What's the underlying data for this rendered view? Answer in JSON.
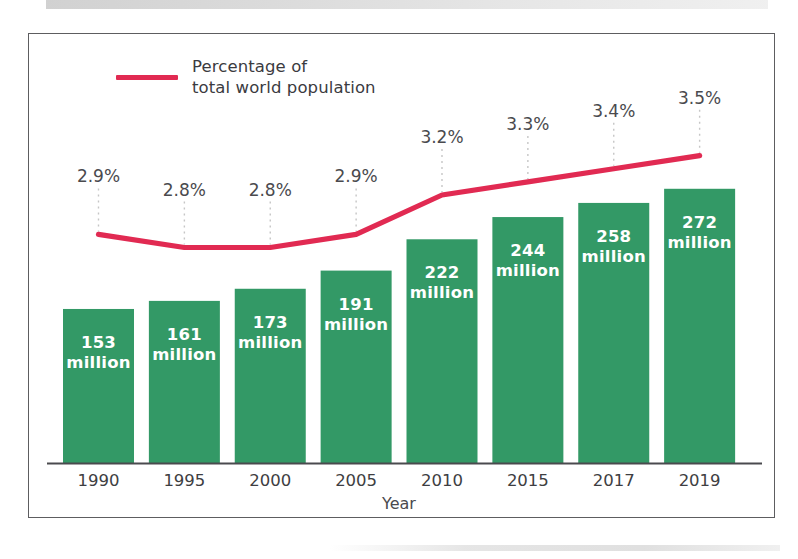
{
  "chart_data": {
    "type": "bar",
    "title": "",
    "subtitle": "",
    "xlabel": "Year",
    "ylabel": "",
    "grid": false,
    "legend_position": "top-left",
    "categories": [
      "1990",
      "1995",
      "2000",
      "2005",
      "2010",
      "2015",
      "2017",
      "2019"
    ],
    "series": [
      {
        "name": "International migrants",
        "type": "bar",
        "unit": "million",
        "values": [
          153,
          161,
          173,
          191,
          222,
          244,
          258,
          272
        ],
        "value_labels": [
          "153\nmillion",
          "161\nmillion",
          "173\nmillion",
          "191\nmillion",
          "222\nmillion",
          "244\nmillion",
          "258\nmillion",
          "272\nmillion"
        ],
        "color": "#339966"
      },
      {
        "name": "Percentage of total world population",
        "type": "line",
        "unit": "%",
        "values": [
          2.9,
          2.8,
          2.8,
          2.9,
          3.2,
          3.3,
          3.4,
          3.5
        ],
        "value_labels": [
          "2.9%",
          "2.8%",
          "2.8%",
          "2.9%",
          "3.2%",
          "3.3%",
          "3.4%",
          "3.5%"
        ],
        "color": "#e12a52"
      }
    ],
    "bar_ylim": [
      0,
      400
    ],
    "line_ylim": [
      2.4,
      4.0
    ]
  },
  "legend": {
    "line_label": "Percentage of\ntotal world population",
    "line_color": "#e12a52"
  },
  "axis": {
    "x_title": "Year",
    "ticks": [
      "1990",
      "1995",
      "2000",
      "2005",
      "2010",
      "2015",
      "2017",
      "2019"
    ]
  },
  "colors": {
    "bar_green": "#339966",
    "line_red": "#e12a52",
    "frame": "#5d5d60",
    "baseline": "#4a4a4e",
    "leader": "#c6c6c6",
    "label_text": "#4a4a4e",
    "bar_text": "#ffffff"
  }
}
